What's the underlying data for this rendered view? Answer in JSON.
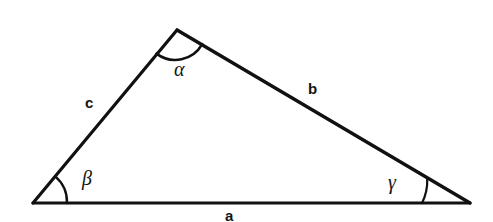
{
  "figure": {
    "type": "geometry-diagram",
    "shape": "triangle",
    "background_color": "#ffffff",
    "stroke_color": "#111111",
    "stroke_width": 3,
    "arc_stroke_width": 2
  },
  "diagram": {
    "vertices": {
      "apex": {
        "name": "A",
        "x": 177,
        "y": 30
      },
      "bottom_left": {
        "name": "B",
        "x": 33,
        "y": 203
      },
      "bottom_right": {
        "name": "C",
        "x": 470,
        "y": 203
      }
    },
    "sides": [
      {
        "id": "a",
        "label": "a",
        "from": "bottom_left",
        "to": "bottom_right",
        "label_x": 230,
        "label_y": 216
      },
      {
        "id": "b",
        "label": "b",
        "from": "apex",
        "to": "bottom_right",
        "label_x": 314,
        "label_y": 90
      },
      {
        "id": "c",
        "label": "c",
        "from": "bottom_left",
        "to": "apex",
        "label_x": 92,
        "label_y": 103
      }
    ],
    "angles": [
      {
        "id": "alpha",
        "label": "α",
        "at_vertex": "apex",
        "label_x": 182,
        "label_y": 70,
        "arc_radius": 26
      },
      {
        "id": "beta",
        "label": "β",
        "at_vertex": "bottom_left",
        "label_x": 88,
        "label_y": 180,
        "arc_radius": 34
      },
      {
        "id": "gamma",
        "label": "γ",
        "at_vertex": "bottom_right",
        "label_x": 395,
        "label_y": 183,
        "arc_radius": 48
      }
    ]
  },
  "labels": {
    "side_a": "a",
    "side_b": "b",
    "side_c": "c",
    "angle_alpha": "α",
    "angle_beta": "β",
    "angle_gamma": "γ"
  }
}
